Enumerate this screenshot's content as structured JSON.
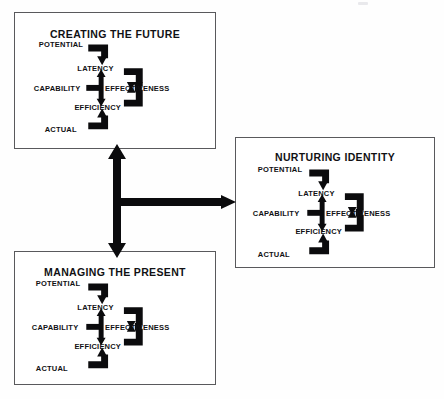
{
  "diagram": {
    "background_color": "#ffffff",
    "ink_color": "#0b0b0d",
    "border_color": "#59595c",
    "panels": [
      {
        "id": "creating-the-future",
        "title": "CREATING THE FUTURE",
        "nodes": {
          "potential": "POTENTIAL",
          "latency": "LATENCY",
          "capability": "CAPABILITY",
          "effectiveness": "EFFECTIVENESS",
          "efficiency": "EFFICIENCY",
          "actual": "ACTUAL"
        }
      },
      {
        "id": "nurturing-identity",
        "title": "NURTURING IDENTITY",
        "nodes": {
          "potential": "POTENTIAL",
          "latency": "LATENCY",
          "capability": "CAPABILITY",
          "effectiveness": "EFFECTIVENESS",
          "efficiency": "EFFICIENCY",
          "actual": "ACTUAL"
        }
      },
      {
        "id": "managing-the-present",
        "title": "MANAGING THE PRESENT",
        "nodes": {
          "potential": "POTENTIAL",
          "latency": "LATENCY",
          "capability": "CAPABILITY",
          "effectiveness": "EFFECTIVENESS",
          "efficiency": "EFFICIENCY",
          "actual": "ACTUAL"
        }
      }
    ],
    "connectors": {
      "vertical": {
        "name": "vertical-double-arrow",
        "from": "managing-the-present",
        "to": "creating-the-future",
        "double_headed": true
      },
      "horizontal": {
        "name": "horizontal-arrow",
        "from": "center-junction",
        "to": "nurturing-identity",
        "double_headed": false
      }
    }
  }
}
